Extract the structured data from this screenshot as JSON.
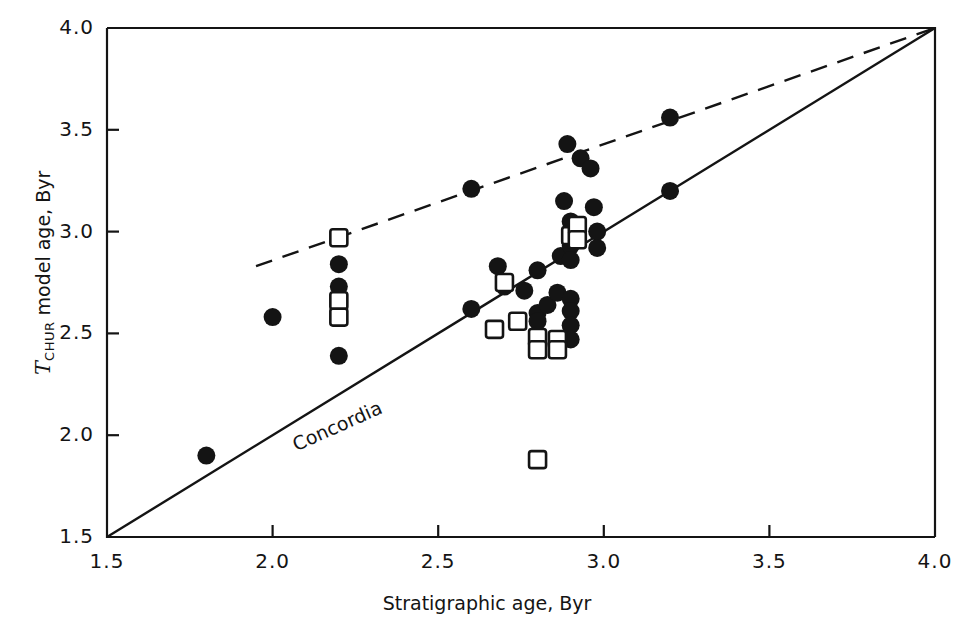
{
  "figure": {
    "type": "scatter",
    "background": "#ffffff",
    "ink_color": "#141414"
  },
  "chart_data": {
    "type": "scatter",
    "title": "",
    "xlabel": "Stratigraphic age, Byr",
    "ylabel": "T_CHUR model age, Byr",
    "ylabel_parts": {
      "italic": "T",
      "subscript": "CHUR",
      "rest": " model age, Byr"
    },
    "xlim": [
      1.5,
      4.0
    ],
    "ylim": [
      1.5,
      4.0
    ],
    "xticks": [
      1.5,
      2.0,
      2.5,
      3.0,
      3.5,
      4.0
    ],
    "yticks": [
      1.5,
      2.0,
      2.5,
      3.0,
      3.5,
      4.0
    ],
    "xtick_labels": [
      "1.5",
      "2.0",
      "2.5",
      "3.0",
      "3.5",
      "4.0"
    ],
    "ytick_labels": [
      "1.5",
      "2.0",
      "2.5",
      "3.0",
      "3.5",
      "4.0"
    ],
    "grid": false,
    "legend": "none",
    "annotations": [
      {
        "text": "Concordia",
        "x": 2.05,
        "y": 2.0,
        "rotation": -24,
        "name": "concordia-label"
      }
    ],
    "reference_lines": [
      {
        "name": "concordia-line",
        "style": "solid",
        "label": "Concordia",
        "points": [
          [
            1.5,
            1.5
          ],
          [
            4.0,
            4.0
          ]
        ]
      },
      {
        "name": "upper-envelope-line",
        "style": "dashed",
        "label": "",
        "points": [
          [
            1.95,
            2.83
          ],
          [
            4.0,
            4.0
          ]
        ]
      }
    ],
    "series": [
      {
        "name": "filled circles",
        "marker": "filled-circle",
        "color": "#141414",
        "points": [
          [
            1.8,
            1.9
          ],
          [
            2.0,
            2.58
          ],
          [
            2.2,
            2.84
          ],
          [
            2.2,
            2.73
          ],
          [
            2.2,
            2.39
          ],
          [
            2.6,
            3.21
          ],
          [
            2.6,
            2.62
          ],
          [
            2.68,
            2.83
          ],
          [
            2.7,
            2.73
          ],
          [
            2.76,
            2.71
          ],
          [
            2.8,
            2.81
          ],
          [
            2.8,
            2.6
          ],
          [
            2.8,
            2.56
          ],
          [
            2.83,
            2.64
          ],
          [
            2.86,
            2.7
          ],
          [
            2.87,
            2.88
          ],
          [
            2.88,
            3.15
          ],
          [
            2.89,
            3.43
          ],
          [
            2.9,
            3.05
          ],
          [
            2.9,
            2.93
          ],
          [
            2.9,
            2.86
          ],
          [
            2.9,
            2.67
          ],
          [
            2.9,
            2.61
          ],
          [
            2.9,
            2.54
          ],
          [
            2.9,
            2.47
          ],
          [
            2.93,
            3.36
          ],
          [
            2.96,
            3.31
          ],
          [
            2.97,
            3.12
          ],
          [
            2.98,
            3.0
          ],
          [
            2.98,
            2.92
          ],
          [
            3.2,
            3.56
          ],
          [
            3.2,
            3.2
          ]
        ]
      },
      {
        "name": "open squares",
        "marker": "open-square",
        "color": "#141414",
        "points": [
          [
            2.2,
            2.97
          ],
          [
            2.2,
            2.66
          ],
          [
            2.2,
            2.58
          ],
          [
            2.67,
            2.52
          ],
          [
            2.7,
            2.75
          ],
          [
            2.74,
            2.56
          ],
          [
            2.8,
            2.48
          ],
          [
            2.8,
            2.42
          ],
          [
            2.8,
            1.88
          ],
          [
            2.86,
            2.47
          ],
          [
            2.86,
            2.42
          ],
          [
            2.9,
            2.98
          ],
          [
            2.92,
            3.03
          ],
          [
            2.92,
            2.96
          ]
        ]
      }
    ]
  }
}
